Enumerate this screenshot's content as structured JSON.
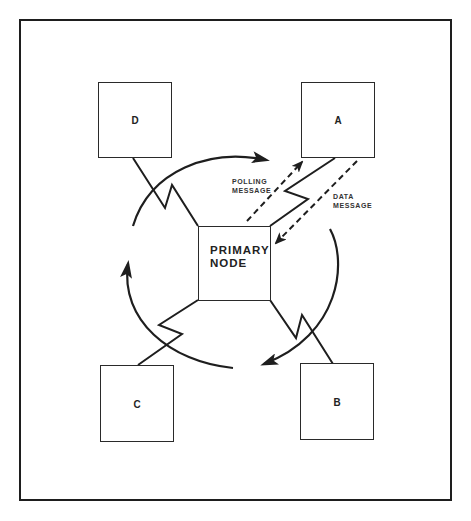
{
  "diagram": {
    "primary_node": {
      "line1": "PRIMARY",
      "line2": "NODE"
    },
    "nodes": [
      {
        "id": "A",
        "label": "A"
      },
      {
        "id": "B",
        "label": "B"
      },
      {
        "id": "C",
        "label": "C"
      },
      {
        "id": "D",
        "label": "D"
      }
    ],
    "messages": {
      "polling": {
        "line1": "POLLING",
        "line2": "MESSAGE"
      },
      "data": {
        "line1": "DATA",
        "line2": "MESSAGE"
      }
    },
    "colors": {
      "line": "#1e1e1e",
      "background": "#ffffff"
    }
  }
}
